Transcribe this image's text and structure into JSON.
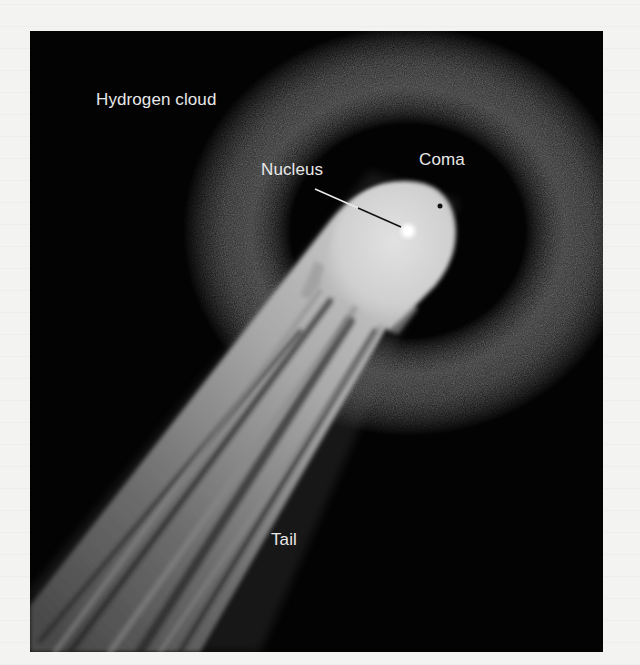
{
  "figure": {
    "background_color": "#030303",
    "page_color": "#f3f3f1",
    "labels": {
      "hydrogen_cloud": "Hydrogen cloud",
      "nucleus": "Nucleus",
      "coma": "Coma",
      "tail": "Tail"
    },
    "parts": [
      {
        "name": "Hydrogen cloud",
        "description": "faint grainy ring surrounding the coma"
      },
      {
        "name": "Coma",
        "description": "bright rounded head of the comet"
      },
      {
        "name": "Nucleus",
        "description": "small bright dot inside the coma, indicated by a leader line"
      },
      {
        "name": "Tail",
        "description": "long streaked tail extending to lower left"
      }
    ]
  }
}
